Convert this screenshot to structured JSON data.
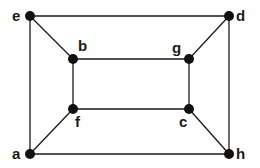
{
  "graph": {
    "nodes": [
      {
        "id": "e",
        "label": "e",
        "x": 30,
        "y": 16,
        "lx": 12,
        "ly": 21
      },
      {
        "id": "d",
        "label": "d",
        "x": 229,
        "y": 16,
        "lx": 236,
        "ly": 21
      },
      {
        "id": "b",
        "label": "b",
        "x": 73,
        "y": 59,
        "lx": 78,
        "ly": 51
      },
      {
        "id": "g",
        "label": "g",
        "x": 189,
        "y": 59,
        "lx": 172,
        "ly": 53
      },
      {
        "id": "f",
        "label": "f",
        "x": 73,
        "y": 109,
        "lx": 75,
        "ly": 127
      },
      {
        "id": "c",
        "label": "c",
        "x": 189,
        "y": 109,
        "lx": 179,
        "ly": 127
      },
      {
        "id": "a",
        "label": "a",
        "x": 30,
        "y": 154,
        "lx": 12,
        "ly": 159
      },
      {
        "id": "h",
        "label": "h",
        "x": 229,
        "y": 154,
        "lx": 236,
        "ly": 159
      }
    ],
    "edges": [
      [
        "e",
        "d"
      ],
      [
        "e",
        "b"
      ],
      [
        "e",
        "a"
      ],
      [
        "d",
        "g"
      ],
      [
        "d",
        "h"
      ],
      [
        "b",
        "g"
      ],
      [
        "b",
        "f"
      ],
      [
        "g",
        "c"
      ],
      [
        "f",
        "c"
      ],
      [
        "f",
        "a"
      ],
      [
        "c",
        "h"
      ],
      [
        "a",
        "h"
      ]
    ],
    "colors": {
      "node": "#111111",
      "edge": "#1a1a1a",
      "background": "#ffffff"
    }
  }
}
